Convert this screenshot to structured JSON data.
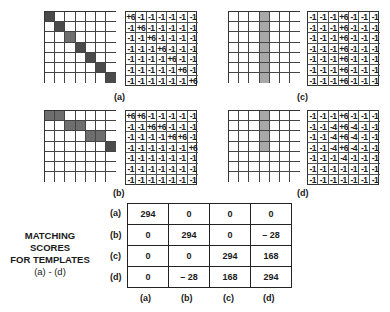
{
  "panels": [
    {
      "id": "a",
      "label": "(a)",
      "shading": [
        [
          0,
          0,
          "dark"
        ],
        [
          1,
          1,
          "dark"
        ],
        [
          2,
          2,
          "mid"
        ],
        [
          3,
          3,
          "dark"
        ],
        [
          4,
          4,
          "dark"
        ],
        [
          5,
          5,
          "dark"
        ],
        [
          6,
          6,
          "dark"
        ]
      ],
      "matrix": [
        [
          "+6",
          "-1",
          "-1",
          "-1",
          "-1",
          "-1",
          "-1"
        ],
        [
          "-1",
          "+6",
          "-1",
          "-1",
          "-1",
          "-1",
          "-1"
        ],
        [
          "-1",
          "-1",
          "+6",
          "-1",
          "-1",
          "-1",
          "-1"
        ],
        [
          "-1",
          "-1",
          "-1",
          "+6",
          "-1",
          "-1",
          "-1"
        ],
        [
          "-1",
          "-1",
          "-1",
          "-1",
          "+6",
          "-1",
          "-1"
        ],
        [
          "-1",
          "-1",
          "-1",
          "-1",
          "-1",
          "+6",
          "-1"
        ],
        [
          "-1",
          "-1",
          "-1",
          "-1",
          "-1",
          "-1",
          "+6"
        ]
      ]
    },
    {
      "id": "b",
      "label": "(b)",
      "shading": [
        [
          0,
          0,
          "mid"
        ],
        [
          0,
          1,
          "mid"
        ],
        [
          1,
          2,
          "mid"
        ],
        [
          1,
          3,
          "mid"
        ],
        [
          2,
          4,
          "mid"
        ],
        [
          2,
          5,
          "mid"
        ],
        [
          3,
          6,
          "dark"
        ]
      ],
      "matrix": [
        [
          "+6",
          "+6",
          "-1",
          "-1",
          "-1",
          "-1",
          "-1"
        ],
        [
          "-1",
          "-1",
          "+6",
          "+6",
          "-1",
          "-1",
          "-1"
        ],
        [
          "-1",
          "-1",
          "-1",
          "-1",
          "+6",
          "+6",
          "-1"
        ],
        [
          "-1",
          "-1",
          "-1",
          "-1",
          "-1",
          "-1",
          "+6"
        ],
        [
          "-1",
          "-1",
          "-1",
          "-1",
          "-1",
          "-1",
          "-1"
        ],
        [
          "-1",
          "-1",
          "-1",
          "-1",
          "-1",
          "-1",
          "-1"
        ],
        [
          "-1",
          "-1",
          "-1",
          "-1",
          "-1",
          "-1",
          "-1"
        ]
      ]
    },
    {
      "id": "c",
      "label": "(c)",
      "shading": [
        [
          0,
          3,
          "light"
        ],
        [
          1,
          3,
          "light"
        ],
        [
          2,
          3,
          "light"
        ],
        [
          3,
          3,
          "light"
        ],
        [
          4,
          3,
          "light"
        ],
        [
          5,
          3,
          "light"
        ],
        [
          6,
          3,
          "light"
        ]
      ],
      "matrix": [
        [
          "-1",
          "-1",
          "-1",
          "+6",
          "-1",
          "-1",
          "-1"
        ],
        [
          "-1",
          "-1",
          "-1",
          "+6",
          "-1",
          "-1",
          "-1"
        ],
        [
          "-1",
          "-1",
          "-1",
          "+6",
          "-1",
          "-1",
          "-1"
        ],
        [
          "-1",
          "-1",
          "-1",
          "+6",
          "-1",
          "-1",
          "-1"
        ],
        [
          "-1",
          "-1",
          "-1",
          "+6",
          "-1",
          "-1",
          "-1"
        ],
        [
          "-1",
          "-1",
          "-1",
          "+6",
          "-1",
          "-1",
          "-1"
        ],
        [
          "-1",
          "-1",
          "-1",
          "+6",
          "-1",
          "-1",
          "-1"
        ]
      ]
    },
    {
      "id": "d",
      "label": "(d)",
      "shading": [
        [
          0,
          3,
          "light"
        ],
        [
          1,
          3,
          "light"
        ],
        [
          2,
          3,
          "light"
        ],
        [
          3,
          3,
          "light"
        ]
      ],
      "matrix": [
        [
          "-1",
          "-1",
          "-1",
          "+6",
          "-1",
          "-1",
          "-1"
        ],
        [
          "-1",
          "-1",
          "-4",
          "+6",
          "-4",
          "-1",
          "-1"
        ],
        [
          "-1",
          "-1",
          "-4",
          "+6",
          "-4",
          "-1",
          "-1"
        ],
        [
          "-1",
          "-1",
          "-4",
          "+6",
          "-4",
          "-1",
          "-1"
        ],
        [
          "-1",
          "-1",
          "-1",
          "-4",
          "-1",
          "-1",
          "-1"
        ],
        [
          "-1",
          "-1",
          "-1",
          "-1",
          "-1",
          "-1",
          "-1"
        ],
        [
          "-1",
          "-1",
          "-1",
          "-1",
          "-1",
          "-1",
          "-1"
        ]
      ]
    }
  ],
  "scores": {
    "caption": [
      "MATCHING SCORES",
      "FOR TEMPLATES",
      "(a) - (d)"
    ],
    "row_labels": [
      "(a)",
      "(b)",
      "(c)",
      "(d)"
    ],
    "col_labels": [
      "(a)",
      "(b)",
      "(c)",
      "(d)"
    ],
    "values": [
      [
        "294",
        "0",
        "0",
        "0"
      ],
      [
        "0",
        "294",
        "0",
        "– 28"
      ],
      [
        "0",
        "0",
        "294",
        "168"
      ],
      [
        "0",
        "– 28",
        "168",
        "294"
      ]
    ]
  }
}
